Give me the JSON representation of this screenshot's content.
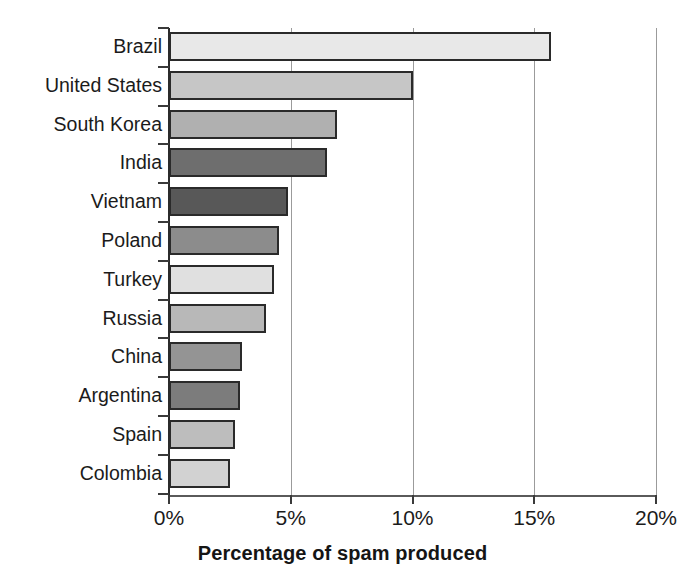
{
  "chart_data": {
    "type": "bar",
    "orientation": "horizontal",
    "title": "",
    "xlabel": "Percentage of spam produced",
    "ylabel": "",
    "xlim": [
      0,
      20
    ],
    "xticks": [
      0,
      5,
      10,
      15,
      20
    ],
    "xticklabels": [
      "0%",
      "5%",
      "10%",
      "15%",
      "20%"
    ],
    "grid": "vertical",
    "legend": "none",
    "unit": "%",
    "categories": [
      "Brazil",
      "United States",
      "South Korea",
      "India",
      "Vietnam",
      "Poland",
      "Turkey",
      "Russia",
      "China",
      "Argentina",
      "Spain",
      "Colombia"
    ],
    "values": [
      15.7,
      10.0,
      6.9,
      6.5,
      4.9,
      4.5,
      4.3,
      4.0,
      3.0,
      2.9,
      2.7,
      2.5
    ],
    "bar_colors": [
      "#e8e8e8",
      "#c6c6c6",
      "#b0b0b0",
      "#6e6e6e",
      "#585858",
      "#8c8c8c",
      "#e0e0e0",
      "#b8b8b8",
      "#949494",
      "#7c7c7c",
      "#bdbdbd",
      "#d2d2d2"
    ],
    "bar_edge_color": "#2a2a2a",
    "axis_color": "#2b2b2b",
    "gridline_color": "#9b9b9b",
    "background_color": "#ffffff"
  }
}
